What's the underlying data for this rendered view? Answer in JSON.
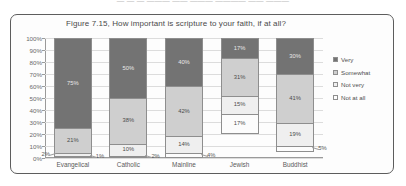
{
  "page": {
    "top_cut_text": "—  —  —   ——— —— ——— ———— —— ———"
  },
  "legend": {
    "position": "right",
    "items": [
      {
        "label": "Very",
        "color": "#737373",
        "icon": "legend-swatch"
      },
      {
        "label": "Somewhat",
        "color": "#cfcfcf",
        "icon": "legend-swatch"
      },
      {
        "label": "Not very",
        "color": "#efefef",
        "icon": "legend-swatch"
      },
      {
        "label": "Not at all",
        "color": "#fdfdfd",
        "icon": "legend-swatch"
      }
    ]
  },
  "chart_data": {
    "type": "bar",
    "subtype": "100% stacked column",
    "title": "Figure 7.15, How important is scripture to your faith, if at all?",
    "xlabel": "",
    "ylabel": "",
    "ylim": [
      0,
      100
    ],
    "grid": true,
    "yticks": [
      "0%",
      "10%",
      "20%",
      "30%",
      "40%",
      "50%",
      "60%",
      "70%",
      "80%",
      "90%",
      "100%"
    ],
    "categories": [
      "Evangelical",
      "Catholic",
      "Mainline",
      "Jewish",
      "Buddhist"
    ],
    "series": [
      {
        "name": "Very",
        "values": [
          75,
          50,
          40,
          17,
          30
        ],
        "labels": [
          "75%",
          "50%",
          "40%",
          "17%",
          "30%"
        ]
      },
      {
        "name": "Somewhat",
        "values": [
          21,
          38,
          42,
          31,
          41
        ],
        "labels": [
          "21%",
          "38%",
          "42%",
          "31%",
          "41%"
        ]
      },
      {
        "name": "Not very",
        "values": [
          2,
          10,
          14,
          15,
          19
        ],
        "labels": [
          "2%",
          "10%",
          "14%",
          "15%",
          "19%"
        ]
      },
      {
        "name": "Not at all",
        "values": [
          1,
          2,
          4,
          17,
          5
        ],
        "labels": [
          "1%",
          "2%",
          "4%",
          "17%",
          "5%"
        ]
      }
    ]
  }
}
